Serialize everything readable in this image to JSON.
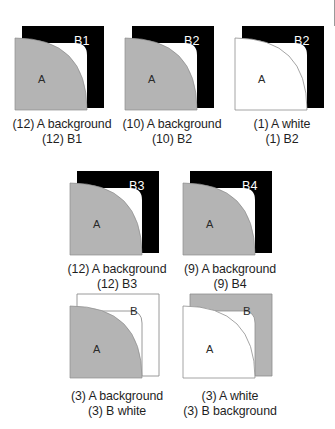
{
  "figure": {
    "colors": {
      "background_gray": "#b4b4b4",
      "black": "#000000",
      "white": "#ffffff",
      "outline": "#9a9a9a",
      "text": "#1f1f1f"
    },
    "panels": [
      {
        "id": "panel-1",
        "a_label": "A",
        "b_label": "B1",
        "a_fill": "background",
        "b_fill": "black",
        "caption_line1": "(12) A background",
        "caption_line2": "(12) B1"
      },
      {
        "id": "panel-2",
        "a_label": "A",
        "b_label": "B2",
        "a_fill": "background",
        "b_fill": "black",
        "caption_line1": "(10) A background",
        "caption_line2": "(10) B2"
      },
      {
        "id": "panel-3",
        "a_label": "A",
        "b_label": "B2",
        "a_fill": "white",
        "b_fill": "black",
        "caption_line1": "(1) A white",
        "caption_line2": "(1) B2"
      },
      {
        "id": "panel-4",
        "a_label": "A",
        "b_label": "B3",
        "a_fill": "background",
        "b_fill": "black",
        "caption_line1": "(12) A background",
        "caption_line2": "(12) B3"
      },
      {
        "id": "panel-5",
        "a_label": "A",
        "b_label": "B4",
        "a_fill": "background",
        "b_fill": "black",
        "caption_line1": "(9) A background",
        "caption_line2": "(9) B4"
      },
      {
        "id": "panel-6",
        "a_label": "A",
        "b_label": "B",
        "a_fill": "background",
        "b_fill": "white",
        "caption_line1": "(3) A background",
        "caption_line2": "(3) B white"
      },
      {
        "id": "panel-7",
        "a_label": "A",
        "b_label": "B",
        "a_fill": "white",
        "b_fill": "background",
        "caption_line1": "(3) A white",
        "caption_line2": "(3) B background"
      }
    ]
  }
}
